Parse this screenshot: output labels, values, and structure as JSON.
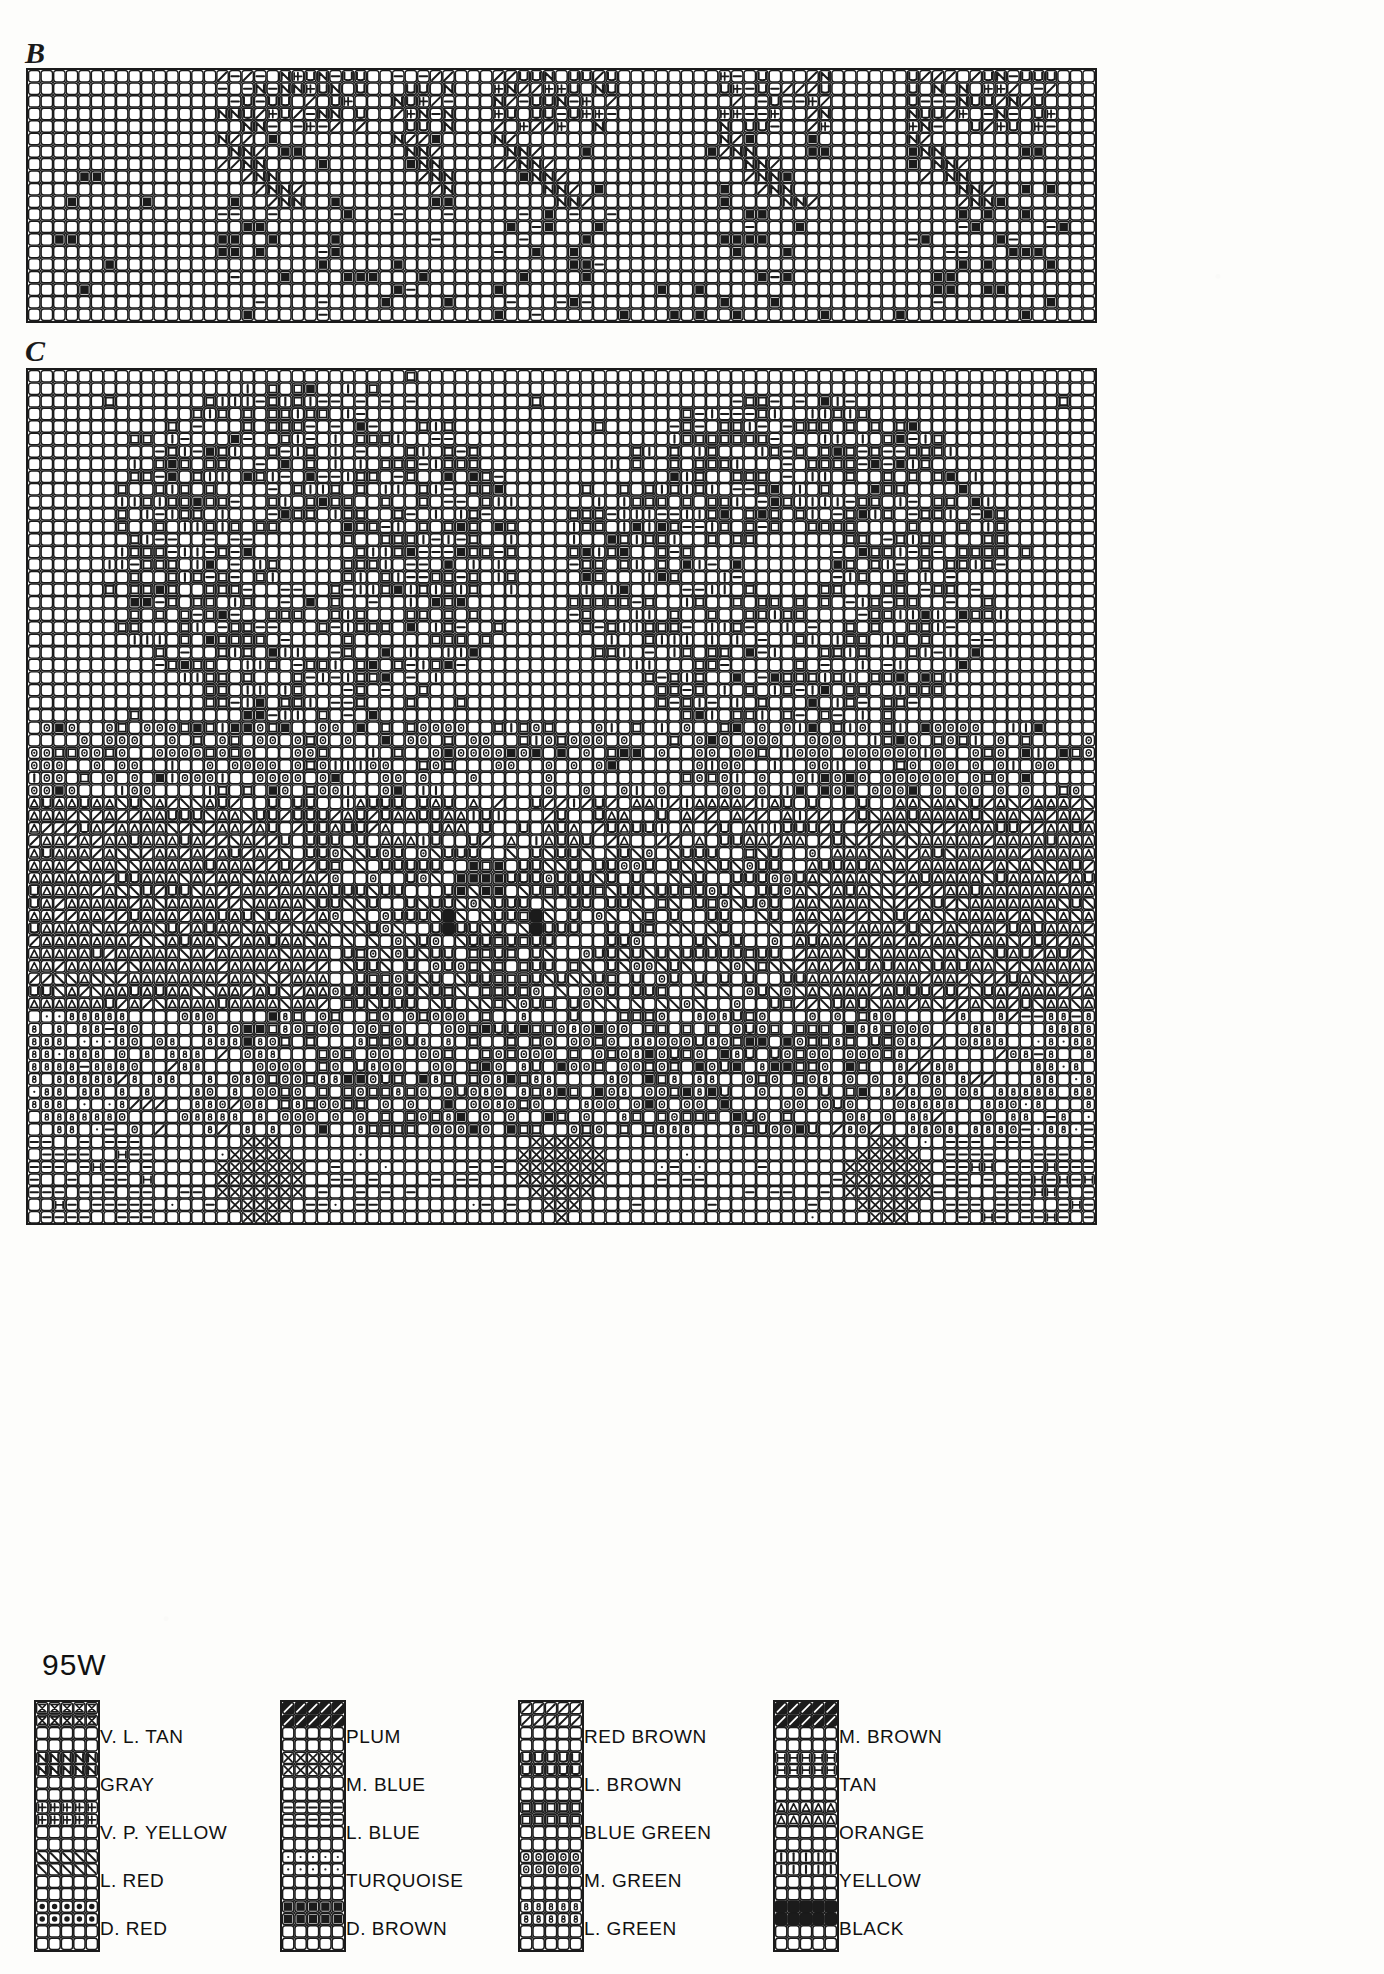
{
  "page": {
    "pattern_code": "95W",
    "background_color": "#fdfdfb",
    "ink_color": "#1b1b1b"
  },
  "charts": [
    {
      "id": "B",
      "label": "B",
      "x": 26,
      "y": 68,
      "cols": 85,
      "rows": 20,
      "cell": 12.55,
      "description": "Narrow horizontal border band chart"
    },
    {
      "id": "C",
      "label": "C",
      "x": 26,
      "y": 368,
      "cols": 85,
      "rows": 68,
      "cell": 12.55,
      "description": "Large main motif chart"
    }
  ],
  "legend": {
    "title": "95W",
    "columns": [
      {
        "entries": [
          {
            "name": "V. L. TAN",
            "symbol": "v-l-tan",
            "glyph": "bowtie"
          },
          {
            "name": "GRAY",
            "symbol": "gray",
            "glyph": "N"
          },
          {
            "name": "V. P. YELLOW",
            "symbol": "v-p-yellow",
            "glyph": "plus-bar"
          },
          {
            "name": "L. RED",
            "symbol": "l-red",
            "glyph": "backslash"
          },
          {
            "name": "D. RED",
            "symbol": "d-red",
            "glyph": "filled-dot"
          }
        ]
      },
      {
        "entries": [
          {
            "name": "PLUM",
            "symbol": "plum",
            "glyph": "solid-slash"
          },
          {
            "name": "M. BLUE",
            "symbol": "m-blue",
            "glyph": "X"
          },
          {
            "name": "L. BLUE",
            "symbol": "l-blue",
            "glyph": "dash"
          },
          {
            "name": "TURQUOISE",
            "symbol": "turquoise",
            "glyph": "small-dot"
          },
          {
            "name": "D. BROWN",
            "symbol": "d-brown",
            "glyph": "filled-block"
          }
        ]
      },
      {
        "entries": [
          {
            "name": "RED BROWN",
            "symbol": "red-brown",
            "glyph": "slash"
          },
          {
            "name": "L. BROWN",
            "symbol": "l-brown",
            "glyph": "U"
          },
          {
            "name": "BLUE GREEN",
            "symbol": "blue-green",
            "glyph": "square-outline"
          },
          {
            "name": "M. GREEN",
            "symbol": "m-green",
            "glyph": "ring-dot"
          },
          {
            "name": "L. GREEN",
            "symbol": "l-green",
            "glyph": "8"
          }
        ]
      },
      {
        "entries": [
          {
            "name": "M. BROWN",
            "symbol": "m-brown",
            "glyph": "solid-slash"
          },
          {
            "name": "TAN",
            "symbol": "tan",
            "glyph": "H-bar"
          },
          {
            "name": "ORANGE",
            "symbol": "orange",
            "glyph": "triangle"
          },
          {
            "name": "YELLOW",
            "symbol": "yellow",
            "glyph": "pipe"
          },
          {
            "name": "BLACK",
            "symbol": "black",
            "glyph": "solid-black"
          }
        ]
      }
    ]
  },
  "chart_data": {
    "type": "heatmap",
    "title": "95W",
    "xlabel": "",
    "ylabel": "",
    "grid": true,
    "legend_position": "bottom",
    "note": "Counted cross-stitch symbol chart. Each grid cell holds one floss symbol; blank cells are unstitched background.",
    "symbols": [
      "bowtie",
      "N",
      "plus-bar",
      "backslash",
      "filled-dot",
      "solid-slash",
      "X",
      "dash",
      "small-dot",
      "filled-block",
      "slash",
      "U",
      "square-outline",
      "ring-dot",
      "8",
      "H-bar",
      "triangle",
      "pipe",
      "solid-black"
    ],
    "categories": [
      "V. L. TAN",
      "GRAY",
      "V. P. YELLOW",
      "L. RED",
      "D. RED",
      "PLUM",
      "M. BLUE",
      "L. BLUE",
      "TURQUOISE",
      "D. BROWN",
      "RED BROWN",
      "L. BROWN",
      "BLUE GREEN",
      "M. GREEN",
      "L. GREEN",
      "M. BROWN",
      "TAN",
      "ORANGE",
      "YELLOW",
      "BLACK"
    ],
    "charts": [
      {
        "name": "B",
        "cols": 85,
        "rows": 20
      },
      {
        "name": "C",
        "cols": 85,
        "rows": 68
      }
    ]
  }
}
